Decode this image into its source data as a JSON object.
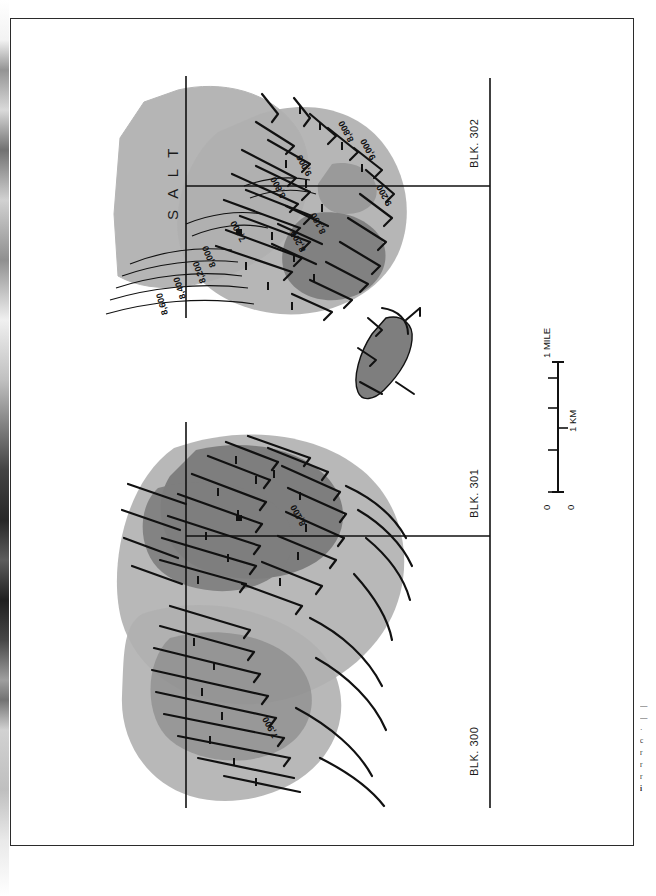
{
  "figure": {
    "type": "geological-structure-map",
    "title_visible": false,
    "salt_label": "S A L T",
    "block_labels": [
      {
        "name": "BLK. 300",
        "id": "blk-300"
      },
      {
        "name": "BLK. 301",
        "id": "blk-301"
      },
      {
        "name": "BLK. 302",
        "id": "blk-302"
      }
    ],
    "contour_labels": [
      "7,900",
      "8,000",
      "8,200",
      "8,400",
      "8,600",
      "8,800",
      "9,000",
      "8,100",
      "8,200",
      "8,800",
      "9,000",
      "9,200",
      "8,100",
      "7,900"
    ],
    "scale_bar": {
      "mile_label": "1 MILE",
      "km_label": "1 KM",
      "zero_label_top": "0",
      "zero_label_bottom": "0",
      "mile_ticks": 2,
      "km_ticks": 3
    },
    "colors": {
      "salt_fill": "#b5b5b5",
      "shade_light": "#b0b0b0",
      "shade_dark": "#7e7e7e",
      "line": "#111111",
      "frame": "#2b2b2b",
      "background": "#ffffff"
    }
  },
  "caption": {
    "lines": [
      "—",
      "—",
      "·",
      "c",
      "r",
      "r",
      "r",
      "i"
    ]
  }
}
